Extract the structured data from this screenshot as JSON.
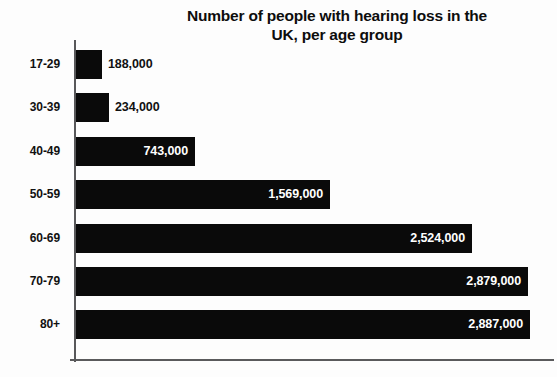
{
  "chart_data": {
    "type": "bar",
    "orientation": "horizontal",
    "title": "Number of people with hearing loss in the UK, per age group",
    "title_lines": [
      "Number of people with hearing loss in the",
      "UK, per age group"
    ],
    "xlabel": "",
    "ylabel": "",
    "categories": [
      "17-29",
      "30-39",
      "40-49",
      "50-59",
      "60-69",
      "70-79",
      "80+"
    ],
    "values": [
      188000,
      234000,
      743000,
      1569000,
      2524000,
      2879000,
      2887000
    ],
    "value_labels": [
      "188,000",
      "234,000",
      "743,000",
      "1,569,000",
      "2,524,000",
      "2,879,000",
      "2,887,000"
    ],
    "label_placement": [
      "outside",
      "outside",
      "inside",
      "inside",
      "inside",
      "inside",
      "inside"
    ],
    "xlim": [
      0,
      2950000
    ],
    "grid": false,
    "legend": null,
    "bar_color": "#0a0a0a",
    "inside_label_color": "#ffffff",
    "outside_label_color": "#111111",
    "axis_color": "#58585a",
    "background_color": "#fdfdfd"
  },
  "bars": [
    {
      "category": "17-29",
      "value_label": "188,000",
      "value": 188000,
      "width_px": 26,
      "placement": "outside"
    },
    {
      "category": "30-39",
      "value_label": "234,000",
      "value": 234000,
      "width_px": 33,
      "placement": "outside"
    },
    {
      "category": "40-49",
      "value_label": "743,000",
      "value": 743000,
      "width_px": 119,
      "placement": "inside"
    },
    {
      "category": "50-59",
      "value_label": "1,569,000",
      "value": 1569000,
      "width_px": 254,
      "placement": "inside"
    },
    {
      "category": "60-69",
      "value_label": "2,524,000",
      "value": 2524000,
      "width_px": 396,
      "placement": "inside"
    },
    {
      "category": "70-79",
      "value_label": "2,879,000",
      "value": 2879000,
      "width_px": 452,
      "placement": "inside"
    },
    {
      "category": "80+",
      "value_label": "2,887,000",
      "value": 2887000,
      "width_px": 454,
      "placement": "inside"
    }
  ]
}
